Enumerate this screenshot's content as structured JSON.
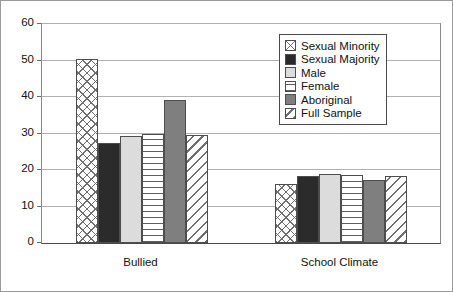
{
  "chart_data": {
    "type": "bar",
    "title": "",
    "xlabel": "",
    "ylabel": "",
    "ylim": [
      0,
      60
    ],
    "yticks": [
      0,
      10,
      20,
      30,
      40,
      50,
      60
    ],
    "grid": true,
    "legend_position": "upper-right-inside",
    "categories": [
      "Bullied",
      "School Climate"
    ],
    "series": [
      {
        "name": "Sexual Minority",
        "pattern": "crosshatch",
        "values": [
          50.5,
          16.1
        ]
      },
      {
        "name": "Sexual Majority",
        "pattern": "solid-dark",
        "values": [
          27.3,
          18.4
        ]
      },
      {
        "name": "Male",
        "pattern": "light-gray",
        "values": [
          29.2,
          18.9
        ]
      },
      {
        "name": "Female",
        "pattern": "horizontal-lines",
        "values": [
          29.8,
          18.5
        ]
      },
      {
        "name": "Aboriginal",
        "pattern": "mid-gray",
        "values": [
          39.2,
          17.2
        ]
      },
      {
        "name": "Full Sample",
        "pattern": "diagonal-hatch",
        "values": [
          29.5,
          18.3
        ]
      }
    ],
    "colors": {
      "crosshatch": "#ffffff",
      "solid-dark": "#2b2b2b",
      "light-gray": "#dcdcdc",
      "horizontal-lines": "#ffffff",
      "mid-gray": "#7f7f7f",
      "diagonal-hatch": "#ffffff",
      "gridline": "#b0b0b0",
      "axis": "#4a4a4a"
    }
  }
}
